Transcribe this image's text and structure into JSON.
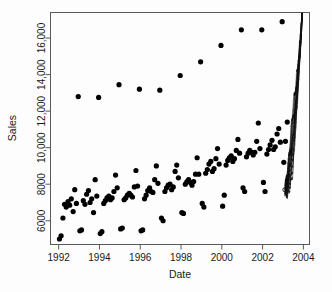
{
  "chart_data": {
    "type": "scatter",
    "title": "",
    "xlabel": "Date",
    "ylabel": "Sales",
    "xlim": [
      1991.6,
      2004.3
    ],
    "ylim": [
      4700,
      17400
    ],
    "grid": false,
    "legend": null,
    "xticks": [
      1992,
      1994,
      1996,
      1998,
      2000,
      2002,
      2004
    ],
    "xtick_labels": [
      "1992",
      "1994",
      "1996",
      "1998",
      "2000",
      "2002",
      "2004"
    ],
    "yticks": [
      6000,
      8000,
      10000,
      12000,
      14000,
      16000
    ],
    "ytick_labels": [
      "6000",
      "8000",
      "10,000",
      "12,000",
      "14,000",
      "16,000"
    ],
    "point_color": "#000000",
    "point_marker": "filled-circle",
    "point_size_px": 2.6,
    "series": [
      {
        "name": "Monthly sales observations",
        "x": [
          1992.04,
          1992.12,
          1992.21,
          1992.29,
          1992.37,
          1992.46,
          1992.54,
          1992.62,
          1992.71,
          1992.79,
          1992.87,
          1993.04,
          1993.12,
          1993.21,
          1993.29,
          1993.37,
          1993.46,
          1993.54,
          1993.62,
          1993.71,
          1993.79,
          1993.87,
          1994.04,
          1994.12,
          1994.21,
          1994.29,
          1994.37,
          1994.46,
          1994.54,
          1994.62,
          1994.71,
          1994.79,
          1994.87,
          1995.04,
          1995.12,
          1995.21,
          1995.29,
          1995.37,
          1995.46,
          1995.54,
          1995.62,
          1995.71,
          1995.79,
          1995.87,
          1996.04,
          1996.12,
          1996.21,
          1996.29,
          1996.37,
          1996.46,
          1996.54,
          1996.62,
          1996.71,
          1996.79,
          1996.87,
          1997.04,
          1997.12,
          1997.21,
          1997.29,
          1997.37,
          1997.46,
          1997.54,
          1997.62,
          1997.71,
          1997.79,
          1997.87,
          1998.04,
          1998.12,
          1998.21,
          1998.29,
          1998.37,
          1998.46,
          1998.54,
          1998.62,
          1998.71,
          1998.79,
          1998.87,
          1999.04,
          1999.12,
          1999.21,
          1999.29,
          1999.37,
          1999.46,
          1999.54,
          1999.62,
          1999.71,
          1999.79,
          1999.87,
          2000.04,
          2000.12,
          2000.21,
          2000.29,
          2000.37,
          2000.46,
          2000.54,
          2000.62,
          2000.71,
          2000.79,
          2000.87,
          2001.04,
          2001.12,
          2001.21,
          2001.29,
          2001.37,
          2001.46,
          2001.54,
          2001.62,
          2001.71,
          2001.79,
          2001.87,
          2002.04,
          2002.12,
          2002.21,
          2002.29,
          2002.37,
          2002.46,
          2002.54,
          2002.62,
          2002.71,
          2002.79,
          2002.87,
          2003.04,
          2003.12,
          2003.21
        ],
        "y": [
          5000,
          5180,
          6150,
          6900,
          6750,
          7050,
          6850,
          7200,
          6500,
          7700,
          6950,
          5450,
          5500,
          7100,
          6900,
          7450,
          7650,
          7000,
          7200,
          6450,
          8250,
          7350,
          5300,
          5400,
          6950,
          7100,
          7250,
          7350,
          7150,
          7250,
          7600,
          8500,
          7800,
          5550,
          5600,
          7150,
          7250,
          7400,
          7500,
          7400,
          7300,
          7850,
          8750,
          7900,
          5450,
          5500,
          7200,
          7400,
          7650,
          7800,
          7600,
          7550,
          8250,
          9000,
          8050,
          6150,
          6000,
          7600,
          7800,
          7950,
          8000,
          7700,
          7850,
          8700,
          9050,
          8350,
          6450,
          6400,
          8000,
          8150,
          8250,
          8100,
          7950,
          8150,
          8550,
          9450,
          8550,
          6950,
          6750,
          8600,
          8800,
          9100,
          9250,
          8700,
          8850,
          9400,
          9950,
          9100,
          6800,
          7400,
          9050,
          9300,
          9450,
          9550,
          9250,
          9400,
          9850,
          10450,
          9700,
          7800,
          7600,
          9500,
          9700,
          9850,
          9750,
          9600,
          9750,
          10350,
          11350,
          9950,
          8100,
          7600,
          9650,
          9900,
          10150,
          10400,
          9900,
          10050,
          10750,
          11050,
          10300,
          9200,
          10350,
          11400
        ]
      },
      {
        "name": "December peak observations",
        "x": [
          1992.96,
          1993.96,
          1994.96,
          1995.96,
          1996.96,
          1997.96,
          1998.96,
          1999.96,
          2000.96,
          2001.96,
          2002.96
        ],
        "y": [
          12800,
          12750,
          13450,
          13200,
          13150,
          13950,
          14700,
          15600,
          16450,
          16450,
          16900
        ]
      }
    ],
    "annotations": [
      {
        "name": "forecast-fan",
        "description": "Dense zig-zag forecast path with widening prediction fan from early 2003 rising off the top of the panel near 2004",
        "x_start": 2003.1,
        "x_end": 2003.95,
        "y_start": 7700,
        "y_end": 17400
      }
    ]
  },
  "axes": {
    "y_title": "Sales",
    "x_title": "Date"
  }
}
